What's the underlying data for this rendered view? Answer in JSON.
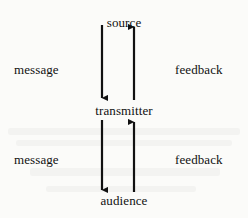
{
  "diagram": {
    "background_color": "#fbfbf9",
    "ink_color": "#111111",
    "nodes": [
      {
        "id": "source",
        "label": "source",
        "x": 123,
        "y": 16
      },
      {
        "id": "transmitter",
        "label": "transmitter",
        "x": 123,
        "y": 112
      },
      {
        "id": "audience",
        "label": "audience",
        "x": 123,
        "y": 203
      }
    ],
    "side_labels": [
      {
        "id": "message-upper",
        "label": "message",
        "side": "left",
        "x": 14,
        "y": 63
      },
      {
        "id": "feedback-upper",
        "label": "feedback",
        "side": "right",
        "x": 175,
        "y": 63
      },
      {
        "id": "message-lower",
        "label": "message",
        "side": "left",
        "x": 14,
        "y": 153
      },
      {
        "id": "feedback-lower",
        "label": "feedback",
        "side": "right",
        "x": 175,
        "y": 153
      }
    ],
    "arrows": [
      {
        "id": "source-to-transmitter",
        "from": "source",
        "to": "transmitter",
        "direction": "down",
        "relation": "message",
        "x": 102,
        "y1": 25,
        "y2": 100
      },
      {
        "id": "transmitter-to-source",
        "from": "transmitter",
        "to": "source",
        "direction": "up",
        "relation": "feedback",
        "x": 134,
        "y1": 100,
        "y2": 25
      },
      {
        "id": "transmitter-to-audience",
        "from": "transmitter",
        "to": "audience",
        "direction": "down",
        "relation": "message",
        "x": 102,
        "y1": 120,
        "y2": 192
      },
      {
        "id": "audience-to-transmitter",
        "from": "audience",
        "to": "transmitter",
        "direction": "up",
        "relation": "feedback",
        "x": 134,
        "y1": 192,
        "y2": 120
      }
    ]
  }
}
